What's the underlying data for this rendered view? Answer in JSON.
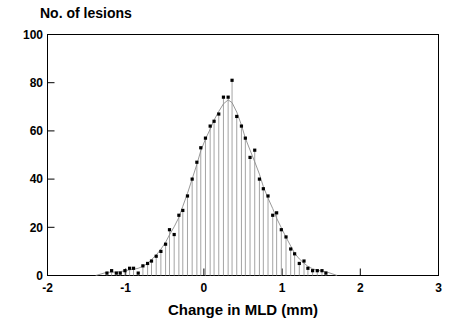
{
  "figure": {
    "width": 459,
    "height": 324,
    "background": "#ffffff",
    "ink_color": "#000000",
    "stem_color": "#9a9a9a",
    "curve_color": "#8c8c8c"
  },
  "chart_data": {
    "type": "bar",
    "plot_style": "stem-needle-histogram-with-smooth-fit",
    "title": "No. of lesions",
    "ylabel": "No. of lesions",
    "xlabel": "Change in MLD (mm)",
    "xlim": [
      -2,
      3
    ],
    "ylim": [
      0,
      100
    ],
    "xticks": [
      -2,
      -1,
      0,
      1,
      2,
      3
    ],
    "xtick_labels": [
      "-2",
      "-1",
      "0",
      "1",
      "2",
      "3"
    ],
    "yticks": [
      0,
      20,
      40,
      60,
      80,
      100
    ],
    "ytick_labels": [
      "0",
      "20",
      "40",
      "60",
      "80",
      "100"
    ],
    "grid": false,
    "legend": null,
    "bin_width": 0.0575,
    "x": [
      -1.24,
      -1.18,
      -1.12,
      -1.07,
      -1.01,
      -0.95,
      -0.9,
      -0.84,
      -0.78,
      -0.72,
      -0.67,
      -0.61,
      -0.55,
      -0.49,
      -0.44,
      -0.38,
      -0.32,
      -0.27,
      -0.21,
      -0.15,
      -0.09,
      -0.04,
      0.02,
      0.08,
      0.13,
      0.19,
      0.25,
      0.31,
      0.36,
      0.42,
      0.48,
      0.53,
      0.59,
      0.65,
      0.71,
      0.76,
      0.82,
      0.88,
      0.93,
      0.99,
      1.05,
      1.11,
      1.16,
      1.22,
      1.28,
      1.33,
      1.39,
      1.45,
      1.51,
      1.56
    ],
    "values": [
      1,
      2,
      1,
      1,
      2,
      3,
      3,
      1,
      4,
      5,
      6,
      8,
      10,
      13,
      19,
      17,
      25,
      27,
      33,
      40,
      47,
      53,
      57,
      62,
      64,
      67,
      74,
      74,
      81,
      66,
      62,
      57,
      49,
      52,
      40,
      36,
      33,
      25,
      26,
      19,
      16,
      11,
      9,
      5,
      6,
      3,
      2,
      2,
      2,
      1
    ],
    "fit_curve": {
      "description": "smooth unimodal fitted distribution overlaid on the needles",
      "peak_x": 0.2,
      "peak_y": 68
    }
  }
}
